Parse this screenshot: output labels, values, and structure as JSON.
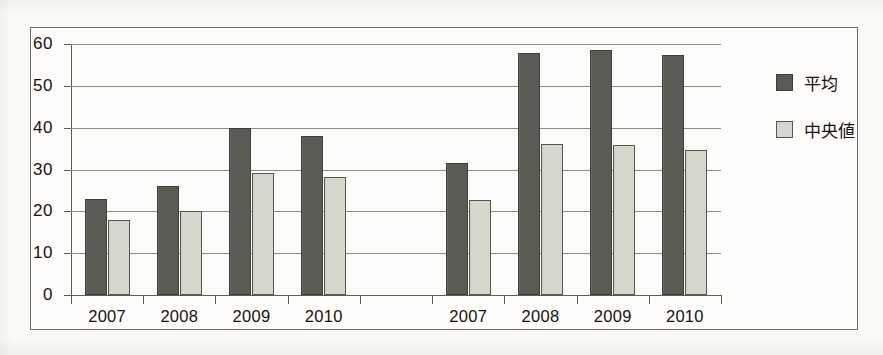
{
  "chart_data": {
    "type": "bar",
    "title": "",
    "subtitle": "",
    "xlabel": "",
    "ylabel": "",
    "ylim": [
      0,
      60
    ],
    "ytick_step": 10,
    "yticks": [
      "0",
      "10",
      "20",
      "30",
      "40",
      "50",
      "60"
    ],
    "grid": true,
    "legend_position": "right",
    "categories": [
      "2007",
      "2008",
      "2009",
      "2010",
      "",
      "2007",
      "2008",
      "2009",
      "2010"
    ],
    "series": [
      {
        "name": "平均",
        "color": "#5b5b53",
        "values": [
          23.0,
          26.0,
          40.0,
          38.0,
          null,
          31.5,
          57.8,
          58.5,
          57.3
        ]
      },
      {
        "name": "中央値",
        "color": "#d6d6cd",
        "values": [
          18.0,
          20.0,
          29.2,
          28.2,
          null,
          22.7,
          36.2,
          35.8,
          34.7
        ]
      }
    ]
  },
  "legend": {
    "items": [
      {
        "label": "平均",
        "swatch": "mean"
      },
      {
        "label": "中央値",
        "swatch": "median"
      }
    ]
  },
  "colors": {
    "mean_fill": "#5b5b53",
    "median_fill": "#d6d6cd",
    "border": "#6f6f68",
    "gridline": "#8d8d85",
    "axis": "#5d5d56",
    "text": "#15130f",
    "paper": "#fbfaf7"
  }
}
